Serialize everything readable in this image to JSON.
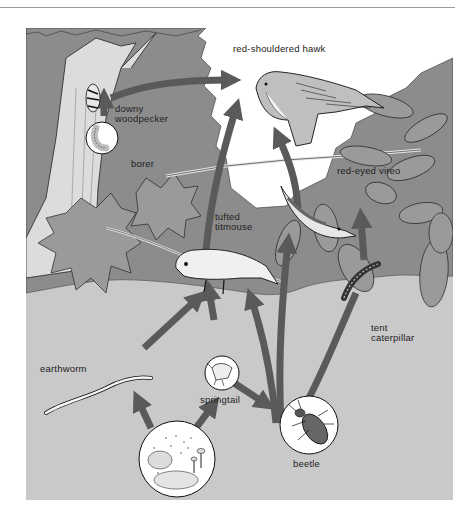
{
  "diagram": {
    "type": "food-web",
    "colors": {
      "sky": "#ffffff",
      "canopy": "#8c8c8c",
      "ground": "#c9c9c9",
      "arrow": "#5a5a5a",
      "line": "#1e1e1e"
    },
    "organisms": {
      "hawk": "red-shouldered hawk",
      "woodpecker": "downy\nwoodpecker",
      "woodpecker_l1": "downy",
      "woodpecker_l2": "woodpecker",
      "borer": "borer",
      "vireo": "red-eyed vireo",
      "titmouse_l1": "tufted",
      "titmouse_l2": "titmouse",
      "caterpillar_l1": "tent",
      "caterpillar_l2": "caterpillar",
      "earthworm": "earthworm",
      "springtail": "springtail",
      "beetle": "beetle",
      "soil": "soil bacteria, fungi"
    },
    "links": [
      {
        "from": "borer",
        "to": "downy woodpecker"
      },
      {
        "from": "downy woodpecker",
        "to": "red-shouldered hawk"
      },
      {
        "from": "tufted titmouse",
        "to": "red-shouldered hawk"
      },
      {
        "from": "red-eyed vireo",
        "to": "red-shouldered hawk"
      },
      {
        "from": "earthworm",
        "to": "tufted titmouse"
      },
      {
        "from": "springtail",
        "to": "tufted titmouse"
      },
      {
        "from": "beetle",
        "to": "tufted titmouse"
      },
      {
        "from": "beetle",
        "to": "red-eyed vireo"
      },
      {
        "from": "tent caterpillar",
        "to": "red-eyed vireo"
      },
      {
        "from": "tent caterpillar",
        "to": "beetle"
      },
      {
        "from": "springtail",
        "to": "beetle"
      },
      {
        "from": "soil bacteria, fungi",
        "to": "earthworm"
      },
      {
        "from": "soil bacteria, fungi",
        "to": "springtail"
      }
    ]
  }
}
